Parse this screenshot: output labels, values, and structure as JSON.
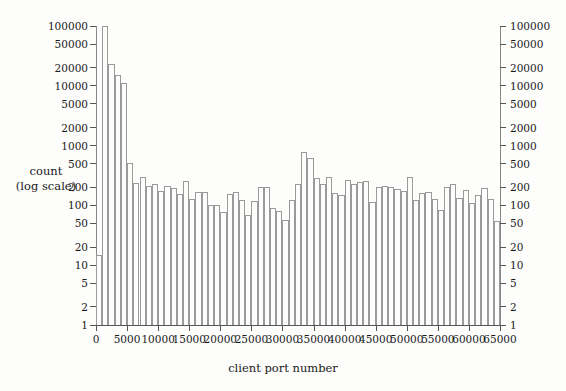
{
  "chart_data": {
    "type": "bar",
    "title": "",
    "subtitle": "",
    "xlabel": "client port number",
    "ylabel_lines": [
      "count",
      "(log scale)"
    ],
    "ylabel": "count (log scale)",
    "yscale": "log",
    "xscale": "linear",
    "xlim": [
      0,
      65000
    ],
    "ylim": [
      1,
      100000
    ],
    "grid": false,
    "legend": null,
    "legend_position": "none",
    "bin_width": 1000,
    "xticks": [
      0,
      5000,
      10000,
      15000,
      20000,
      25000,
      30000,
      35000,
      40000,
      45000,
      50000,
      55000,
      60000,
      65000
    ],
    "xtick_labels": [
      "0",
      "5000",
      "10000",
      "15000",
      "20000",
      "25000",
      "30000",
      "35000",
      "40000",
      "45000",
      "50000",
      "55000",
      "60000",
      "65000"
    ],
    "yticks": [
      1,
      2,
      5,
      10,
      20,
      50,
      100,
      200,
      500,
      1000,
      2000,
      5000,
      10000,
      20000,
      50000,
      100000
    ],
    "ytick_labels": [
      "1",
      "2",
      "5",
      "10",
      "20",
      "50",
      "100",
      "200",
      "500",
      "1000",
      "2000",
      "5000",
      "10000",
      "20000",
      "50000",
      "100000"
    ],
    "right_axis_mirrored": true,
    "categories": [
      "0-1000",
      "1000-2000",
      "2000-3000",
      "3000-4000",
      "4000-5000",
      "5000-6000",
      "6000-7000",
      "7000-8000",
      "8000-9000",
      "9000-10000",
      "10000-11000",
      "11000-12000",
      "12000-13000",
      "13000-14000",
      "14000-15000",
      "15000-16000",
      "16000-17000",
      "17000-18000",
      "18000-19000",
      "19000-20000",
      "20000-21000",
      "21000-22000",
      "22000-23000",
      "23000-24000",
      "24000-25000",
      "25000-26000",
      "26000-27000",
      "27000-28000",
      "28000-29000",
      "29000-30000",
      "30000-31000",
      "31000-32000",
      "32000-33000",
      "33000-34000",
      "34000-35000",
      "35000-36000",
      "36000-37000",
      "37000-38000",
      "38000-39000",
      "39000-40000",
      "40000-41000",
      "41000-42000",
      "42000-43000",
      "43000-44000",
      "44000-45000",
      "45000-46000",
      "46000-47000",
      "47000-48000",
      "48000-49000",
      "49000-50000",
      "50000-51000",
      "51000-52000",
      "52000-53000",
      "53000-54000",
      "54000-55000",
      "55000-56000",
      "56000-57000",
      "57000-58000",
      "58000-59000",
      "59000-60000",
      "60000-61000",
      "61000-62000",
      "62000-63000",
      "63000-64000",
      "64000-65000"
    ],
    "x": [
      500,
      1500,
      2500,
      3500,
      4500,
      5500,
      6500,
      7500,
      8500,
      9500,
      10500,
      11500,
      12500,
      13500,
      14500,
      15500,
      16500,
      17500,
      18500,
      19500,
      20500,
      21500,
      22500,
      23500,
      24500,
      25500,
      26500,
      27500,
      28500,
      29500,
      30500,
      31500,
      32500,
      33500,
      34500,
      35500,
      36500,
      37500,
      38500,
      39500,
      40500,
      41500,
      42500,
      43500,
      44500,
      45500,
      46500,
      47500,
      48500,
      49500,
      50500,
      51500,
      52500,
      53500,
      54500,
      55500,
      56500,
      57500,
      58500,
      59500,
      60500,
      61500,
      62500,
      63500,
      64500
    ],
    "values": [
      15,
      100000,
      23000,
      15000,
      11000,
      510,
      235,
      300,
      210,
      225,
      175,
      215,
      195,
      155,
      260,
      130,
      165,
      170,
      100,
      100,
      78,
      155,
      170,
      125,
      68,
      120,
      200,
      205,
      92,
      80,
      58,
      125,
      230,
      790,
      620,
      290,
      225,
      300,
      160,
      150,
      265,
      225,
      250,
      255,
      115,
      200,
      210,
      205,
      190,
      175,
      300,
      125,
      160,
      170,
      128,
      85,
      200,
      230,
      135,
      180,
      110,
      150,
      195,
      130,
      55
    ]
  }
}
